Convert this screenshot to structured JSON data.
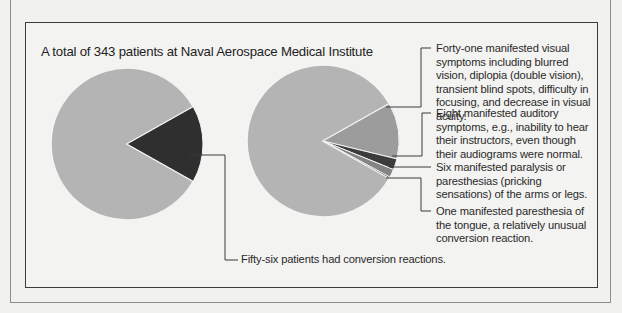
{
  "figure": {
    "title": "A total of 343 patients at Naval Aerospace Medical Institute",
    "left_pie_note": "Fifty-six patients had conversion reactions.",
    "right_pie_notes": [
      "Forty-one manifested visual symptoms including blurred vision, diplopia (double vision), transient blind spots, difficulty in focusing, and decrease in visual acuity.",
      "Eight manifested auditory symptoms, e.g., inability to hear their instructors, even though their audiograms were normal.",
      "Six manifested paralysis or paresthesias (pricking sensations) of the arms or legs.",
      "One manifested paresthesia of the tongue, a relatively unusual conversion reaction."
    ]
  },
  "colors": {
    "background": "#f1f1ef",
    "pie_rest": "#b4b4b4",
    "conversion": "#2f2f2f",
    "visual": "#9c9c9c",
    "auditory": "#3c3c3c",
    "paralysis": "#838383",
    "tongue": "#1f1f1f"
  },
  "chart_data": [
    {
      "type": "pie",
      "title": "A total of 343 patients at Naval Aerospace Medical Institute",
      "categories": [
        "Other patients",
        "Conversion reactions"
      ],
      "values": [
        287,
        56
      ],
      "total": 343,
      "annotations": [
        "Fifty-six patients had conversion reactions."
      ]
    },
    {
      "type": "pie",
      "title": "Breakdown of conversion reactions among 343 patients",
      "categories": [
        "Other patients",
        "Visual symptoms",
        "Auditory symptoms",
        "Paralysis or paresthesias of arms or legs",
        "Paresthesia of the tongue"
      ],
      "values": [
        287,
        41,
        8,
        6,
        1
      ],
      "total": 343,
      "annotations": [
        "Forty-one manifested visual symptoms including blurred vision, diplopia (double vision), transient blind spots, difficulty in focusing, and decrease in visual acuity.",
        "Eight manifested auditory symptoms, e.g., inability to hear their instructors, even though their audiograms were normal.",
        "Six manifested paralysis or paresthesias (pricking sensations) of the arms or legs.",
        "One manifested paresthesia of the tongue, a relatively unusual conversion reaction."
      ]
    }
  ]
}
